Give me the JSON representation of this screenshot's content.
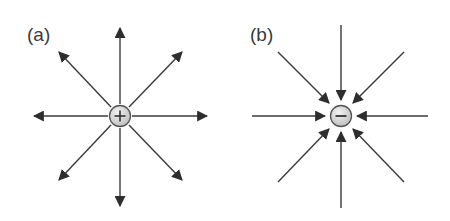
{
  "panels": [
    {
      "label": "(a)",
      "charge": "+",
      "description": "Positive point charge with field lines pointing radially outward",
      "direction": "outward",
      "center": [
        120,
        116
      ]
    },
    {
      "label": "(b)",
      "charge": "−",
      "description": "Negative point charge with field lines pointing radially inward",
      "direction": "inward",
      "center": [
        341,
        116
      ]
    }
  ],
  "colors": {
    "line": "#3a3a3a",
    "charge_fill": "#d9d9d9",
    "charge_stroke": "#555555"
  }
}
